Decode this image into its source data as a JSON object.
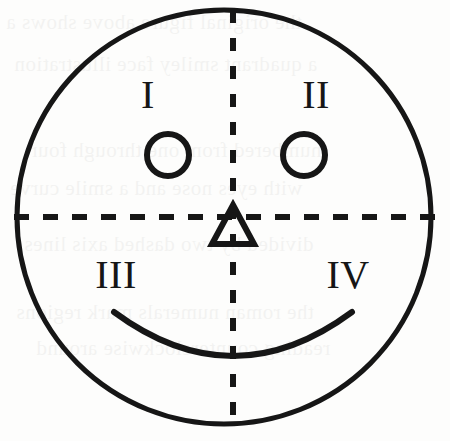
{
  "figure": {
    "background_color": "#fdfdfc",
    "ink_color": "#161616",
    "canvas": {
      "width": 450,
      "height": 441
    }
  },
  "face": {
    "outline": {
      "shape": "circle",
      "center_x": 224,
      "center_y": 217,
      "radius": 207,
      "stroke_width": 5,
      "stroke_color": "#161616",
      "fill": "none"
    },
    "left_eye": {
      "shape": "circle",
      "center_x": 168,
      "center_y": 155,
      "radius": 21,
      "stroke_width": 6,
      "fill": "none"
    },
    "right_eye": {
      "shape": "circle",
      "center_x": 304,
      "center_y": 155,
      "radius": 21,
      "stroke_width": 6,
      "fill": "none"
    },
    "nose": {
      "shape": "triangle",
      "apex_x": 233,
      "apex_y": 205,
      "base_left_x": 212,
      "base_right_x": 254,
      "base_y": 244,
      "stroke_width": 6,
      "fill": "none"
    },
    "mouth": {
      "shape": "arc",
      "description": "upward-curving smile arc",
      "start_x": 114,
      "start_y": 312,
      "end_x": 352,
      "end_y": 312,
      "bottom_y": 362,
      "stroke_width": 6,
      "fill": "none"
    }
  },
  "axes": {
    "vertical": {
      "name": "vertical-dashed-axis",
      "x": 233,
      "y_start": 10,
      "y_end": 430,
      "style": "dashed",
      "dash_on": 13,
      "dash_off": 15,
      "stroke_width": 6
    },
    "horizontal": {
      "name": "horizontal-dashed-axis",
      "y": 217,
      "x_start": 14,
      "x_end": 436,
      "style": "dashed",
      "dash_on": 15,
      "dash_off": 14,
      "stroke_width": 6
    }
  },
  "quadrant_labels": [
    {
      "id": "quadrant-1",
      "text": "I",
      "x": 148,
      "y": 108
    },
    {
      "id": "quadrant-2",
      "text": "II",
      "x": 316,
      "y": 108
    },
    {
      "id": "quadrant-3",
      "text": "III",
      "x": 116,
      "y": 288
    },
    {
      "id": "quadrant-4",
      "text": "IV",
      "x": 348,
      "y": 288
    }
  ],
  "background_bleed": {
    "visible": true,
    "description": "faint reversed show-through text from the opposite page of a scanned book",
    "rows": [
      {
        "text": "the original figure above shows a",
        "x": 6,
        "y": 10
      },
      {
        "text": "a quadrant smiley face illustration",
        "x": 14,
        "y": 52
      },
      {
        "text": "numbered from one through four",
        "x": 30,
        "y": 138
      },
      {
        "text": "with eyes nose and a smile curve",
        "x": 10,
        "y": 176
      },
      {
        "text": "divided by two dashed axis lines",
        "x": 24,
        "y": 232
      },
      {
        "text": "the roman numerals mark regions",
        "x": 16,
        "y": 300
      },
      {
        "text": "reading counterclockwise around",
        "x": 36,
        "y": 336
      }
    ]
  }
}
